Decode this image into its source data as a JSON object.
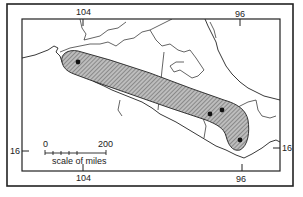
{
  "map": {
    "type": "species distribution map",
    "region": "southern Mexico",
    "longitude_ticks": [
      {
        "label": "104",
        "position": "top"
      },
      {
        "label": "96",
        "position": "top"
      },
      {
        "label": "104",
        "position": "bottom"
      },
      {
        "label": "96",
        "position": "bottom"
      }
    ],
    "latitude_ticks": [
      {
        "label": "16",
        "position": "left"
      },
      {
        "label": "16",
        "position": "right"
      }
    ],
    "scale_bar": {
      "start_label": "0",
      "end_label": "200",
      "caption": "scale of miles"
    },
    "range": {
      "fill": "hatched",
      "description": "elongated band along Pacific slope from western Mexico southeast to Oaxaca"
    },
    "locality_points_count": 4,
    "colors": {
      "ink": "#222222",
      "background": "#ffffff",
      "range_fill": "#9a9a9a"
    }
  }
}
